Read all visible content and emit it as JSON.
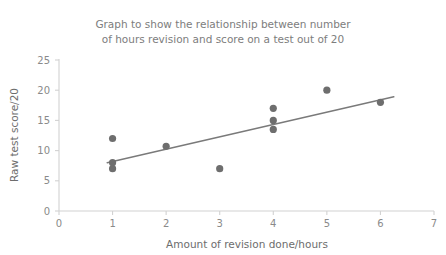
{
  "chart_data": {
    "type": "scatter",
    "title": "Graph to show the relationship between number of hours revision and score on a test out of 20",
    "title_line1": "Graph to show the relationship between number",
    "title_line2": "of hours revision and score on a test out of 20",
    "xlabel": "Amount of revision done/hours",
    "ylabel": "Raw test score/20",
    "xlim": [
      0,
      7
    ],
    "ylim": [
      0,
      25
    ],
    "xticks": [
      0,
      1,
      2,
      3,
      4,
      5,
      6,
      7
    ],
    "yticks": [
      0,
      5,
      10,
      15,
      20,
      25
    ],
    "xtick_labels": [
      "0",
      "1",
      "2",
      "3",
      "4",
      "5",
      "6",
      "7"
    ],
    "ytick_labels": [
      "0",
      "5",
      "10",
      "15",
      "20",
      "25"
    ],
    "grid": false,
    "legend": null,
    "marker_color": "#6e6e6e",
    "line_color": "#7a7a7a",
    "text_color": "#7d7d7d",
    "axis_color": "#d2d2d2",
    "points": [
      {
        "x": 1,
        "y": 12
      },
      {
        "x": 1,
        "y": 8
      },
      {
        "x": 1,
        "y": 7
      },
      {
        "x": 2,
        "y": 10.7
      },
      {
        "x": 3,
        "y": 7
      },
      {
        "x": 4,
        "y": 17
      },
      {
        "x": 4,
        "y": 15
      },
      {
        "x": 4,
        "y": 13.5
      },
      {
        "x": 5,
        "y": 20
      },
      {
        "x": 6,
        "y": 18
      }
    ],
    "trend_line": {
      "x1": 0.9,
      "y1": 8.0,
      "x2": 6.25,
      "y2": 18.9
    }
  }
}
